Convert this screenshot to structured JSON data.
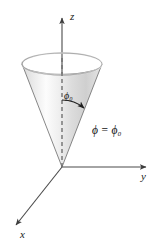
{
  "figure": {
    "type": "3d-coordinate-diagram",
    "background_color": "#ffffff",
    "line_color": "#4a4a4a",
    "axes": {
      "z": {
        "label": "z",
        "direction": "up",
        "origin": [
          62,
          167
        ],
        "tip": [
          62,
          14
        ]
      },
      "y": {
        "label": "y",
        "direction": "right",
        "origin": [
          62,
          167
        ],
        "tip": [
          150,
          167
        ]
      },
      "x": {
        "label": "x",
        "direction": "down-left",
        "origin": [
          62,
          167
        ],
        "tip": [
          12,
          229
        ]
      }
    },
    "labels": {
      "angle": "ϕ₀",
      "surface_equation": "ϕ = ϕ₀"
    },
    "cone": {
      "apex": [
        62,
        167
      ],
      "rim_center": [
        62,
        64
      ],
      "rim_rx": 40,
      "rim_ry": 11,
      "fill_light": "#fbfbfb",
      "fill_mid": "#e3e3e3",
      "fill_dark": "#b8b8b8",
      "rim_inner_dark": "#6f6f6f",
      "stroke": "#555555"
    },
    "angle_arc": {
      "vertex": [
        62,
        167
      ],
      "from": "dashed z-axis",
      "to": "cone surface edge",
      "arrowhead": true
    },
    "dashed_axis": {
      "from": [
        62,
        64
      ],
      "to": [
        62,
        167
      ],
      "style": "dashed",
      "color": "#777777"
    }
  }
}
